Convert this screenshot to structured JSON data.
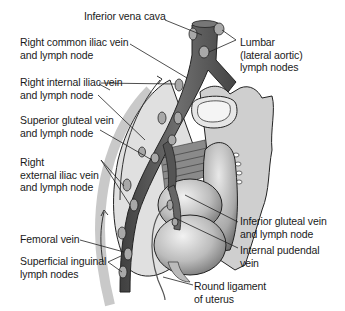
{
  "figure": {
    "labels": {
      "inferior_vena_cava": [
        "Inferior vena cava"
      ],
      "right_common_iliac": [
        "Right common iliac vein",
        "and lymph node"
      ],
      "right_internal_iliac": [
        "Right internal iliac vein",
        "and lymph node"
      ],
      "superior_gluteal": [
        "Superior gluteal vein",
        "and lymph node"
      ],
      "right_external_iliac": [
        "Right",
        "external iliac vein",
        "and lymph node"
      ],
      "femoral_vein": [
        "Femoral vein"
      ],
      "superficial_inguinal": [
        "Superficial inguinal",
        "lymph nodes"
      ],
      "lumbar": [
        "Lumbar",
        "(lateral aortic)",
        "lymph nodes"
      ],
      "inferior_gluteal": [
        "Inferior gluteal vein",
        "and lymph node"
      ],
      "internal_pudendal": [
        "Internal pudendal",
        "vein"
      ],
      "round_ligament": [
        "Round ligament",
        "of uterus"
      ]
    },
    "colors": {
      "vein": "#5c5c5c",
      "node": "#9a9a9a",
      "bone": "#d4d4d4",
      "organ": "#bdbdbd",
      "leader": "#222222",
      "text": "#1a1a1a"
    }
  }
}
